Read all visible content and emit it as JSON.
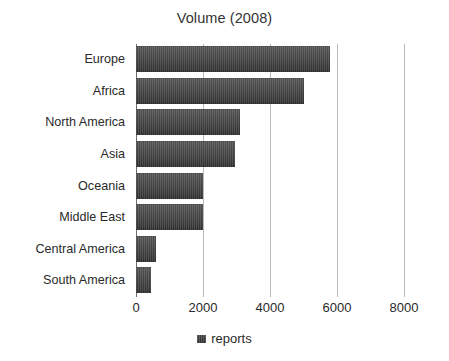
{
  "chart_data": {
    "type": "bar",
    "orientation": "horizontal",
    "title": "Volume (2008)",
    "xlabel": "",
    "ylabel": "",
    "xlim": [
      0,
      8000
    ],
    "xticks": [
      0,
      2000,
      4000,
      6000,
      8000
    ],
    "xtick_labels": [
      "0",
      "2000",
      "4000",
      "6000",
      "8000"
    ],
    "grid": true,
    "grid_axis": "x",
    "legend": {
      "position": "bottom-center",
      "entries": [
        {
          "label": "reports",
          "color": "#434343"
        }
      ]
    },
    "categories": [
      "Europe",
      "Africa",
      "North America",
      "Asia",
      "Oceania",
      "Middle East",
      "Central America",
      "South America"
    ],
    "series": [
      {
        "name": "reports",
        "color": "#434343",
        "values": [
          5800,
          5000,
          3100,
          2950,
          2000,
          2000,
          600,
          450
        ]
      }
    ]
  },
  "colors": {
    "background": "#ffffff",
    "bar_fill": "#434343",
    "gridline": "#b9b9b9",
    "axis": "#6e6e6e",
    "text": "#2a2a2a",
    "title_text": "#333333"
  }
}
